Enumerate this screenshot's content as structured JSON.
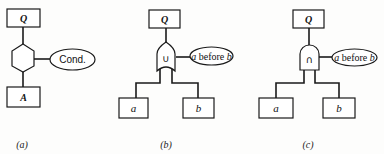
{
  "figure": {
    "panels": [
      {
        "id": "a",
        "caption": "(a)",
        "top_node": "Q",
        "operator": {
          "shape": "hexagon",
          "symbol": ""
        },
        "condition": "Cond.",
        "children": [
          "A"
        ]
      },
      {
        "id": "b",
        "caption": "(b)",
        "top_node": "Q",
        "operator": {
          "shape": "or-gate",
          "symbol": "∪"
        },
        "condition": {
          "var1": "a",
          "word": " before ",
          "var2": "b"
        },
        "children": [
          "a",
          "b"
        ]
      },
      {
        "id": "c",
        "caption": "(c)",
        "top_node": "Q",
        "operator": {
          "shape": "and-gate",
          "symbol": "∩"
        },
        "condition": {
          "var1": "a",
          "word": " before ",
          "var2": "b"
        },
        "children": [
          "a",
          "b"
        ]
      }
    ]
  }
}
